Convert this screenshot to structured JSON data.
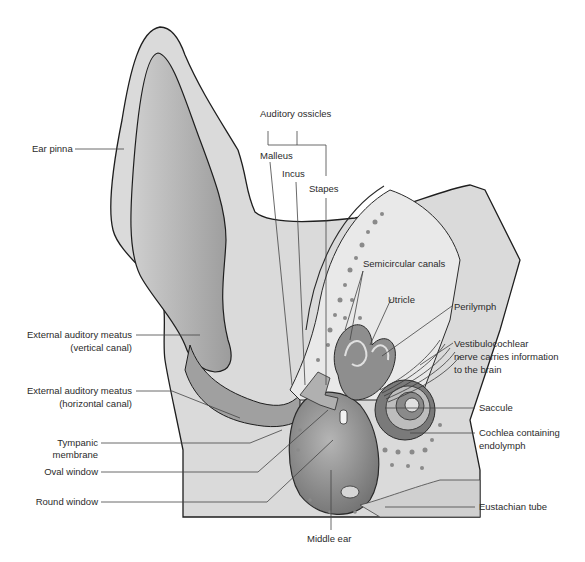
{
  "diagram": {
    "labels": {
      "ear_pinna": "Ear pinna",
      "auditory_ossicles": "Auditory ossicles",
      "malleus": "Malleus",
      "incus": "Incus",
      "stapes": "Stapes",
      "semicircular_canals": "Semicircular canals",
      "utricle": "Utricle",
      "perilymph": "Perilymph",
      "vestibulocochlear_1": "Vestibulocochlear",
      "vestibulocochlear_2": "nerve carries information",
      "vestibulocochlear_3": "to the brain",
      "eam_vertical_1": "External auditory meatus",
      "eam_vertical_2": "(vertical canal)",
      "eam_horizontal_1": "External auditory meatus",
      "eam_horizontal_2": "(horizontal canal)",
      "tympanic_1": "Tympanic",
      "tympanic_2": "membrane",
      "oval_window": "Oval window",
      "round_window": "Round window",
      "saccule": "Saccule",
      "cochlea_1": "Cochlea containing",
      "cochlea_2": "endolymph",
      "eustachian_tube": "Eustachian tube",
      "middle_ear": "Middle ear"
    },
    "colors": {
      "tissue": "#d9d9d9",
      "canal": "#a8a8a8",
      "bone": "#e6e6e6",
      "outline": "#1e1e1e",
      "leader": "#444444"
    }
  }
}
